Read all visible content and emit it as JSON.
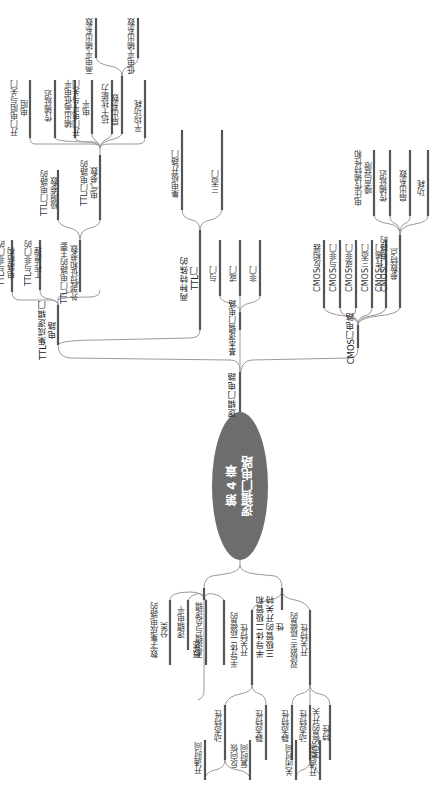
{
  "center": {
    "chapter": "第 4 章",
    "title": "逻辑门电路"
  },
  "upper": {
    "root": "逻辑门电路",
    "ttl": {
      "label": "TTL集成逻辑门\n电路",
      "children": {
        "structure": "TTL与非门的\n电路结构",
        "principle": "TTL与非门的\n工作原理",
        "params": {
          "label": "TTL门电路的主要\n外部特征和参数",
          "limit": {
            "label": "TTL门电路的\n极限参数"
          },
          "electrical": {
            "label": "TTL门电路的\n电气参数",
            "items": [
              "开门电阻与关门\n电阻",
              "传输延迟",
              "输出高低电平",
              "开门电平与关门\n电平",
              "抗干扰能力",
              "扇出系数",
              "平均功耗"
            ],
            "fanout": [
              "高电平输出系数",
              "低电平输出系数"
            ]
          }
        }
      }
    },
    "special_ttl": {
      "label": "两种特殊的\nTTL门",
      "items": [
        "集电极开路门",
        "三态门"
      ]
    },
    "basic": {
      "label": "基本逻辑门电路",
      "items": [
        "与门",
        "或门",
        "非门"
      ]
    },
    "cmos": {
      "label": "CMOS门电路",
      "items": [
        "CMOS反相器",
        "CMOS与非门",
        "CMOS或非门",
        "CMOS三态门",
        "CMOS传输门"
      ],
      "features": {
        "label": "CMOS门电路的\n参数特点",
        "items": [
          "电压传输特性和\n噪声容限",
          "传输延迟",
          "扇出系数",
          "功耗"
        ]
      }
    }
  },
  "lower": {
    "overview": {
      "label": "概述",
      "items": [
        "数字集成电路的\n分类",
        "逻辑电平",
        "正逻辑与负逻辑"
      ]
    },
    "switch": {
      "label": "半导体二极管和\n三极管的开关特\n性",
      "diode": {
        "label": "半导体二极管的\n开关特性",
        "dynamic": {
          "label": "动态特性",
          "items": [
            "开通时间",
            "反向恢\n复时间"
          ]
        },
        "static": "静态特性"
      },
      "bjt": {
        "label": "双极型三极管的\n开关特性",
        "static": "静态特性",
        "dynamic": {
          "label": "动态特性",
          "items": [
            "关闭时间",
            "开通时间"
          ]
        },
        "mos": "MOS管的开关\n特性"
      }
    }
  }
}
